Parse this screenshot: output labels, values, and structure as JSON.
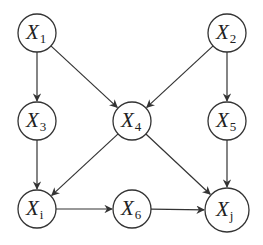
{
  "diagram": {
    "type": "directed-acyclic-graph",
    "nodes": [
      {
        "id": "X1",
        "base": "X",
        "sub": "1",
        "cx": 37,
        "cy": 33,
        "r": 19
      },
      {
        "id": "X2",
        "base": "X",
        "sub": "2",
        "cx": 227,
        "cy": 33,
        "r": 19
      },
      {
        "id": "X3",
        "base": "X",
        "sub": "3",
        "cx": 37,
        "cy": 121,
        "r": 19
      },
      {
        "id": "X4",
        "base": "X",
        "sub": "4",
        "cx": 132,
        "cy": 121,
        "r": 19
      },
      {
        "id": "X5",
        "base": "X",
        "sub": "5",
        "cx": 227,
        "cy": 121,
        "r": 19
      },
      {
        "id": "Xi",
        "base": "X",
        "sub": "i",
        "cx": 37,
        "cy": 209,
        "r": 19
      },
      {
        "id": "X6",
        "base": "X",
        "sub": "6",
        "cx": 132,
        "cy": 209,
        "r": 19
      },
      {
        "id": "Xj",
        "base": "X",
        "sub": "j",
        "cx": 227,
        "cy": 210,
        "r": 22
      }
    ],
    "edges": [
      {
        "from": "X1",
        "to": "X3"
      },
      {
        "from": "X1",
        "to": "X4"
      },
      {
        "from": "X2",
        "to": "X4"
      },
      {
        "from": "X2",
        "to": "X5"
      },
      {
        "from": "X3",
        "to": "Xi"
      },
      {
        "from": "X4",
        "to": "Xi"
      },
      {
        "from": "X4",
        "to": "Xj"
      },
      {
        "from": "X5",
        "to": "Xj"
      },
      {
        "from": "Xi",
        "to": "X6"
      },
      {
        "from": "X6",
        "to": "Xj"
      }
    ],
    "colors": {
      "stroke": "#333333",
      "text": "#222222",
      "background": "#ffffff"
    }
  }
}
